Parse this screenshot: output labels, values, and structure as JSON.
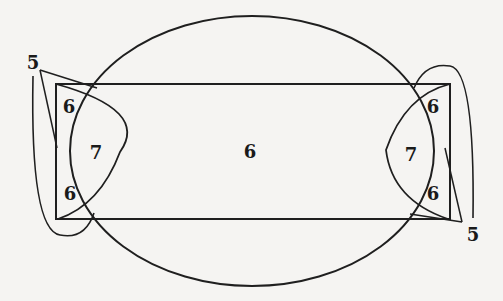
{
  "diagram": {
    "labels": {
      "center_region": "6",
      "left_top_corner": "6",
      "left_bottom_corner": "6",
      "left_lens": "7",
      "right_top_corner": "6",
      "right_bottom_corner": "6",
      "right_lens": "7",
      "left_callout": "5",
      "right_callout": "5"
    },
    "stroke_color": "#1f1f1f",
    "background_color": "#f5f4f2"
  }
}
